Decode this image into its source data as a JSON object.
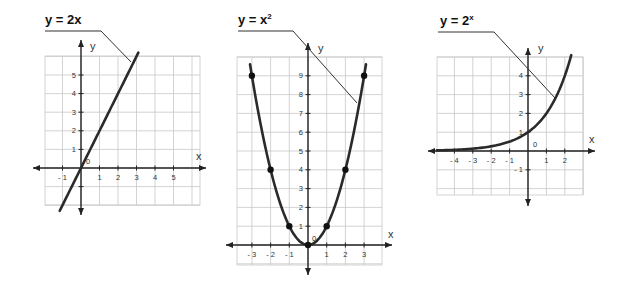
{
  "chart_data": [
    {
      "type": "line",
      "title": "y = 2x",
      "function": "y = 2x",
      "xlabel": "x",
      "ylabel": "y",
      "origin_label": "0",
      "x_ticks": [
        -1,
        1,
        2,
        3,
        4,
        5
      ],
      "y_ticks": [
        -1,
        1,
        2,
        3,
        4,
        5
      ],
      "x_tick_labels": [
        "-1",
        "1",
        "2",
        "3",
        "4",
        "5"
      ],
      "y_tick_labels": [
        "1",
        "2",
        "3",
        "4",
        "5"
      ],
      "xlim": [
        -1.5,
        5.5
      ],
      "ylim": [
        -2,
        6
      ],
      "grid": true,
      "series": [
        {
          "name": "y = 2x",
          "x": [
            -1,
            0,
            1,
            2,
            3
          ],
          "y": [
            -2,
            0,
            2,
            4,
            6
          ]
        }
      ]
    },
    {
      "type": "line",
      "title": "y = x²",
      "function": "y = x^2",
      "xlabel": "x",
      "ylabel": "y",
      "origin_label": "0",
      "x_ticks": [
        -3,
        -2,
        -1,
        1,
        2,
        3
      ],
      "y_ticks": [
        1,
        2,
        3,
        4,
        5,
        6,
        7,
        8,
        9
      ],
      "x_tick_labels": [
        "-3",
        "-2",
        "-1",
        "1",
        "2",
        "3"
      ],
      "y_tick_labels": [
        "1",
        "2",
        "3",
        "4",
        "5",
        "6",
        "7",
        "8",
        "9"
      ],
      "xlim": [
        -3.5,
        4
      ],
      "ylim": [
        -1,
        10
      ],
      "grid": true,
      "series": [
        {
          "name": "y = x²",
          "x": [
            -3,
            -2,
            -1,
            0,
            1,
            2,
            3
          ],
          "y": [
            9,
            4,
            1,
            0,
            1,
            4,
            9
          ]
        }
      ],
      "marked_points": [
        [
          -3,
          9
        ],
        [
          -2,
          4
        ],
        [
          -1,
          1
        ],
        [
          0,
          0
        ],
        [
          1,
          1
        ],
        [
          2,
          4
        ],
        [
          3,
          9
        ]
      ]
    },
    {
      "type": "line",
      "title": "y = 2ˣ",
      "function": "y = 2^x",
      "xlabel": "x",
      "ylabel": "y",
      "origin_label": "0",
      "x_ticks": [
        -4,
        -3,
        -2,
        -1,
        1,
        2
      ],
      "y_ticks": [
        -1,
        1,
        2,
        3,
        4
      ],
      "x_tick_labels": [
        "-4",
        "-3",
        "-2",
        "-1",
        "1",
        "2"
      ],
      "y_tick_labels": [
        "-1",
        "1",
        "2",
        "3",
        "4"
      ],
      "xlim": [
        -5,
        3
      ],
      "ylim": [
        -2.5,
        5
      ],
      "grid": true,
      "series": [
        {
          "name": "y = 2^x",
          "x": [
            -5,
            -4,
            -3,
            -2,
            -1,
            0,
            1,
            2,
            2.3
          ],
          "y": [
            0.03,
            0.06,
            0.13,
            0.25,
            0.5,
            1,
            2,
            4,
            4.9
          ]
        }
      ]
    }
  ],
  "labels": {
    "g1": {
      "title": "y = 2x",
      "x": "x",
      "y": "y",
      "origin": "0"
    },
    "g2": {
      "title_base": "y = x",
      "title_exp": "2",
      "x": "x",
      "y": "y",
      "origin": "0"
    },
    "g3": {
      "title_base": "y = 2",
      "title_exp": "x",
      "x": "x",
      "y": "y",
      "origin": "0"
    }
  }
}
